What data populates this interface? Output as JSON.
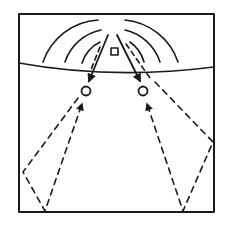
{
  "diagram": {
    "type": "acoustic-ray-diagram",
    "colors": {
      "background": "#ffffff",
      "ink": "#1a1a1a"
    },
    "frame": {
      "x": 19,
      "y": 14,
      "width": 195,
      "height": 198
    },
    "divider": {
      "start": [
        19,
        63
      ],
      "control": [
        112,
        80
      ],
      "end": [
        214,
        67
      ]
    },
    "source": {
      "shape": "square",
      "x": 111,
      "y": 48,
      "size": 7
    },
    "receivers": [
      {
        "id": "left-receiver",
        "cx": 86,
        "cy": 91,
        "r": 4.5
      },
      {
        "id": "right-receiver",
        "cx": 143,
        "cy": 91,
        "r": 4.5
      }
    ],
    "wavefronts": {
      "center": [
        115,
        62
      ],
      "radii": [
        22,
        34,
        48
      ],
      "count_per_side": 3
    },
    "direct_rays": [
      {
        "from": [
          108,
          35
        ],
        "to": [
          89,
          81
        ]
      },
      {
        "from": [
          117,
          35
        ],
        "to": [
          140,
          81
        ]
      }
    ],
    "reflected_rays": [
      {
        "id": "left-outer",
        "points": [
          [
            90,
            66
          ],
          [
            23,
            172
          ],
          [
            45,
            211
          ],
          [
            82,
            104
          ]
        ],
        "arrow_at_end": true
      },
      {
        "id": "right-outer",
        "points": [
          [
            140,
            66
          ],
          [
            213,
            142
          ],
          [
            183,
            211
          ],
          [
            146,
            103
          ]
        ],
        "arrow_at_end": true
      }
    ],
    "labels": []
  }
}
